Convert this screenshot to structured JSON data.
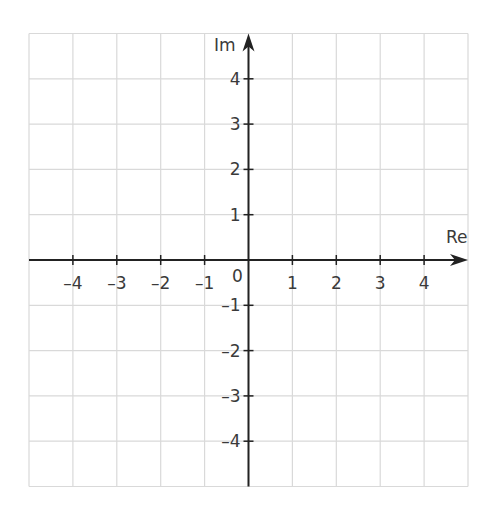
{
  "diagram": {
    "type": "argand-diagram",
    "axes": {
      "x": {
        "label": "Re",
        "min": -5,
        "max": 5,
        "ticks": [
          -4,
          -3,
          -2,
          -1,
          1,
          2,
          3,
          4
        ]
      },
      "y": {
        "label": "Im",
        "min": -5,
        "max": 5,
        "ticks": [
          4,
          3,
          2,
          1,
          -1,
          -2,
          -3,
          -4
        ]
      },
      "origin_label": "0"
    },
    "tick_labels": {
      "x": [
        "–4",
        "–3",
        "–2",
        "–1",
        "1",
        "2",
        "3",
        "4"
      ],
      "y": [
        "4",
        "3",
        "2",
        "1",
        "–1",
        "–2",
        "–3",
        "–4"
      ]
    },
    "grid": {
      "visible": true,
      "step": 1
    },
    "colors": {
      "grid": "#d9d9d9",
      "axis": "#222222",
      "label": "#3a3a3a",
      "background": "#ffffff"
    }
  }
}
